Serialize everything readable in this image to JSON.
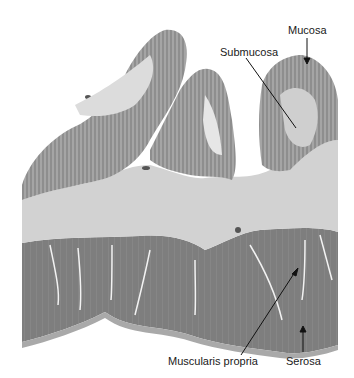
{
  "figure": {
    "type": "histology-micrograph",
    "labels": [
      {
        "id": "mucosa",
        "text": "Mucosa"
      },
      {
        "id": "submucosa",
        "text": "Submucosa"
      },
      {
        "id": "muscularis",
        "text": "Muscularis propria"
      },
      {
        "id": "serosa",
        "text": "Serosa"
      }
    ],
    "colors": {
      "background": "#ffffff",
      "mucosa": "#8a8a8a",
      "submucosa": "#cfcfcf",
      "muscularis": "#7d7d7d",
      "serosa": "#9a9a9a",
      "label_text": "#1a1a1a"
    }
  }
}
